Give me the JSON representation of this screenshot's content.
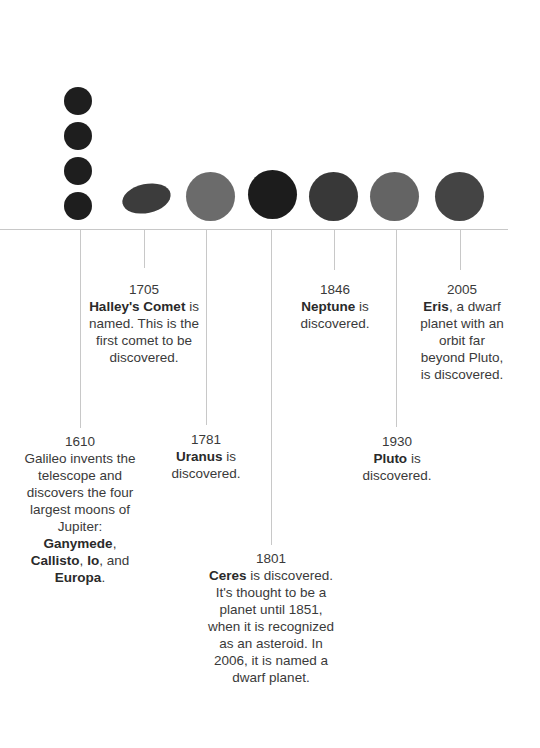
{
  "timeline": {
    "colors": {
      "axis": "#c8c8c8",
      "galileo_moons": "#1e1e1e",
      "halley": "#3c3c3c",
      "uranus": "#6b6b6b",
      "ceres": "#1c1c1c",
      "neptune": "#383838",
      "pluto": "#646464",
      "eris": "#444444"
    },
    "events": [
      {
        "year": "1610",
        "parts": [
          {
            "text": "Galileo invents the telescope and discovers the four largest moons of Jupiter: ",
            "bold": false
          },
          {
            "text": "Ganymede",
            "bold": true
          },
          {
            "text": ", ",
            "bold": false
          },
          {
            "text": "Callisto",
            "bold": true
          },
          {
            "text": ", ",
            "bold": false
          },
          {
            "text": "Io",
            "bold": true
          },
          {
            "text": ", and ",
            "bold": false
          },
          {
            "text": "Europa",
            "bold": true
          },
          {
            "text": ".",
            "bold": false
          }
        ]
      },
      {
        "year": "1705",
        "parts": [
          {
            "text": "Halley's Comet",
            "bold": true
          },
          {
            "text": " is named. This is the first comet to be discovered.",
            "bold": false
          }
        ]
      },
      {
        "year": "1781",
        "parts": [
          {
            "text": "Uranus",
            "bold": true
          },
          {
            "text": " is discovered.",
            "bold": false
          }
        ]
      },
      {
        "year": "1801",
        "parts": [
          {
            "text": "Ceres",
            "bold": true
          },
          {
            "text": " is discovered. It's thought to be a planet until 1851, when it is recognized as an asteroid. In 2006, it is named a dwarf planet.",
            "bold": false
          }
        ]
      },
      {
        "year": "1846",
        "parts": [
          {
            "text": "Neptune",
            "bold": true
          },
          {
            "text": " is discovered.",
            "bold": false
          }
        ]
      },
      {
        "year": "1930",
        "parts": [
          {
            "text": "Pluto",
            "bold": true
          },
          {
            "text": " is discovered.",
            "bold": false
          }
        ]
      },
      {
        "year": "2005",
        "parts": [
          {
            "text": "Eris",
            "bold": true
          },
          {
            "text": ", a dwarf planet with an orbit far beyond Pluto, is discovered.",
            "bold": false
          }
        ]
      }
    ]
  }
}
